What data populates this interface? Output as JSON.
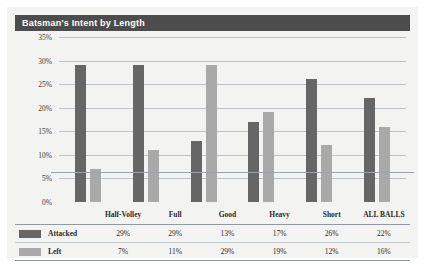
{
  "header": {
    "title": "Batsman's Intent by Length"
  },
  "colors": {
    "title_bar": "#4c4c4c",
    "card_background": "#f3f3f1",
    "attacked": "#666666",
    "left": "#a9a9a9",
    "gridline": "#b9c3cc"
  },
  "legend": {
    "items": [
      {
        "label": "Attacked",
        "swatch": "#666666"
      },
      {
        "label": "Left",
        "swatch": "#a9a9a9"
      }
    ]
  },
  "chart_data": {
    "type": "bar",
    "title": "Batsman's Intent by Length",
    "xlabel": "",
    "ylabel": "",
    "ylim": [
      0,
      35
    ],
    "ytick_labels": [
      "35%",
      "30%",
      "25%",
      "20%",
      "15%",
      "10%",
      "5%",
      "0%"
    ],
    "ytick_values": [
      35,
      30,
      25,
      20,
      15,
      10,
      5,
      0
    ],
    "grid": true,
    "legend_position": "bottom-table",
    "categories": [
      "Half-Volley",
      "Full",
      "Good",
      "Heavy",
      "Short",
      "ALL BALLS"
    ],
    "series": [
      {
        "name": "Attacked",
        "values": [
          29,
          29,
          13,
          17,
          26,
          22
        ],
        "labels": [
          "29%",
          "29%",
          "13%",
          "17%",
          "26%",
          "22%"
        ],
        "color": "#666666"
      },
      {
        "name": "Left",
        "values": [
          7,
          11,
          29,
          19,
          12,
          16
        ],
        "labels": [
          "7%",
          "11%",
          "29%",
          "19%",
          "12%",
          "16%"
        ],
        "color": "#a9a9a9"
      }
    ]
  }
}
